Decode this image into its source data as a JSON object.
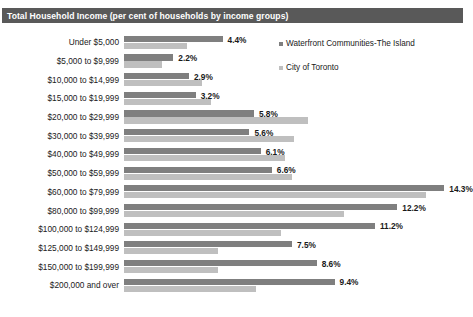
{
  "header": {
    "title": "Total Household Income (per cent of households by income groups)"
  },
  "legend": {
    "items": [
      {
        "label": "Waterfront Communities-The Island",
        "color": "#7f7f7f",
        "marker": "square-marker"
      },
      {
        "label": "City of Toronto",
        "color": "#bfbfbf",
        "marker": "square-marker"
      }
    ]
  },
  "chart_data": {
    "type": "bar",
    "orientation": "horizontal",
    "title": "Total Household Income (per cent of households by income groups)",
    "xlabel": "",
    "ylabel": "",
    "grid": false,
    "legend_position": "top-right",
    "axis_visible": false,
    "tick_labels_visible": false,
    "xlim": [
      0,
      15
    ],
    "value_suffix": "%",
    "categories": [
      "Under $5,000",
      "$5,000 to $9,999",
      "$10,000 to $14,999",
      "$15,000 to $19,999",
      "$20,000 to $29,999",
      "$30,000 to $39,999",
      "$40,000 to $49,999",
      "$50,000 to $59,999",
      "$60,000 to $79,999",
      "$80,000 to $99,999",
      "$100,000 to $124,999",
      "$125,000 to $149,999",
      "$150,000 to $199,999",
      "$200,000 and over"
    ],
    "series": [
      {
        "name": "Waterfront Communities-The Island",
        "color": "#7f7f7f",
        "labels_shown": true,
        "values": [
          4.4,
          2.2,
          2.9,
          3.2,
          5.8,
          5.6,
          6.1,
          6.6,
          14.3,
          12.2,
          11.2,
          7.5,
          8.6,
          9.4
        ],
        "value_labels": [
          "4.4%",
          "2.2%",
          "2.9%",
          "3.2%",
          "5.8%",
          "5.6%",
          "6.1%",
          "6.6%",
          "14.3%",
          "12.2%",
          "11.2%",
          "7.5%",
          "8.6%",
          "9.4%"
        ]
      },
      {
        "name": "City of Toronto",
        "color": "#bfbfbf",
        "labels_shown": false,
        "values": [
          2.8,
          1.7,
          3.5,
          3.9,
          8.2,
          7.6,
          7.2,
          7.5,
          13.5,
          9.8,
          7.0,
          4.2,
          4.2,
          5.9
        ],
        "value_labels": [
          "",
          "",
          "",
          "",
          "",
          "",
          "",
          "",
          "",
          "",
          "",
          "",
          "",
          ""
        ]
      }
    ]
  }
}
